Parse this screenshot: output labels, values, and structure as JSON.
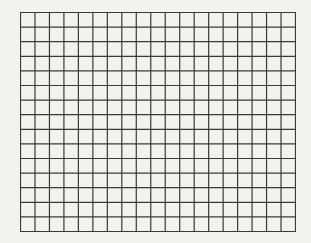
{
  "grid": {
    "columns": 19,
    "rows": 15,
    "left": 20,
    "top": 12,
    "width": 276,
    "height": 220,
    "line_color": "#3a3a3a",
    "background_color": "#f2f2f1",
    "line_width": 1.2
  }
}
